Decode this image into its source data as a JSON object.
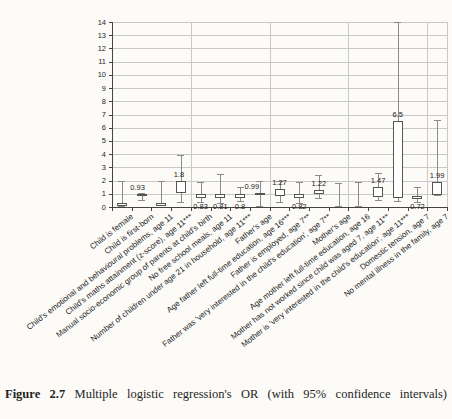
{
  "figure": {
    "label": "Figure 2.7",
    "caption": "Multiple logistic regression's OR (with 95% confidence intervals)"
  },
  "chart_data": {
    "type": "bar",
    "subtype": "odds-ratio-boxes-with-ci-whiskers",
    "title": "",
    "xlabel": "",
    "ylabel": "",
    "ylim": [
      0,
      14
    ],
    "ytick_labels": [
      "0",
      "1",
      "2",
      "3",
      "4",
      "5",
      "6",
      "7",
      "8",
      "9",
      "10",
      "11",
      "12",
      "13",
      "14"
    ],
    "grid": true,
    "legend": "none",
    "categories": [
      {
        "label": "Child is female",
        "or": null,
        "box": [
          0.05,
          0.3
        ],
        "whisker": [
          0.1,
          2.0
        ],
        "label_pos": null
      },
      {
        "label": "Child is first-born",
        "or": "0.93",
        "box": [
          0.8,
          1.0
        ],
        "whisker": [
          0.55,
          1.05
        ],
        "label_pos": "above",
        "solid": true,
        "dx": -4
      },
      {
        "label": "Child's emotional and behavioural problems, age 11",
        "or": null,
        "box": [
          0.1,
          0.32
        ],
        "whisker": [
          0.15,
          2.0
        ],
        "label_pos": null
      },
      {
        "label": "Child's maths attainment (z-score), age 11***",
        "or": "1.8",
        "box": [
          1.05,
          2.0
        ],
        "whisker": [
          0.35,
          3.9
        ],
        "label_pos": "above",
        "dx": -2
      },
      {
        "label": "Manual socio-economic group of parents at child's birth",
        "or": "0.83",
        "box": [
          0.7,
          1.02
        ],
        "whisker": [
          0.35,
          1.9
        ],
        "label_pos": "below"
      },
      {
        "label": "No free school meals, age 11",
        "or": "0.81",
        "box": [
          0.7,
          1.0
        ],
        "whisker": [
          0.3,
          2.5
        ],
        "label_pos": "below"
      },
      {
        "label": "Number of children under age 21 in household, age 11***",
        "or": "0.8",
        "box": [
          0.68,
          1.0
        ],
        "whisker": [
          0.45,
          1.5
        ],
        "label_pos": "below"
      },
      {
        "label": "Father's age",
        "or": "0.99",
        "box": [
          0.92,
          1.06
        ],
        "whisker": [
          0.1,
          2.0
        ],
        "label_pos": "above",
        "dx": -8
      },
      {
        "label": "Age father left full-time education, age 16***",
        "or": "1.27",
        "box": [
          0.85,
          1.35
        ],
        "whisker": [
          0.4,
          2.0
        ],
        "label_pos": "above"
      },
      {
        "label": "Father is employed, age 7**",
        "or": "0.82",
        "box": [
          0.65,
          0.95
        ],
        "whisker": [
          0.3,
          1.9
        ],
        "label_pos": "below"
      },
      {
        "label": "Father was 'very interested in the child's education', age 7**",
        "or": "1.22",
        "box": [
          0.95,
          1.3
        ],
        "whisker": [
          0.65,
          2.4
        ],
        "label_pos": "above"
      },
      {
        "label": "Mother's age",
        "or": null,
        "box": null,
        "whisker": [
          0.05,
          1.8
        ],
        "label_pos": null
      },
      {
        "label": "Age mother left full-time education, age 16",
        "or": null,
        "box": null,
        "whisker": [
          0.05,
          1.9
        ],
        "label_pos": null
      },
      {
        "label": "Mother has not worked since child was aged 7, age 11**",
        "or": "1.47",
        "box": [
          0.75,
          1.5
        ],
        "whisker": [
          0.5,
          2.6
        ],
        "label_pos": "above"
      },
      {
        "label": "Mother is 'very interested in the child's education', age 11***",
        "or": "6.5",
        "box": [
          0.7,
          6.5
        ],
        "whisker": [
          0.45,
          14.0
        ],
        "label_pos": "above"
      },
      {
        "label": "Domestic tension, age 7",
        "or": "0.72",
        "box": [
          0.58,
          0.85
        ],
        "whisker": [
          0.35,
          1.55
        ],
        "label_pos": "below"
      },
      {
        "label": "No mental illness in the family, age 7",
        "or": "1.99",
        "box": [
          0.9,
          1.9
        ],
        "whisker": [
          0.9,
          6.6
        ],
        "label_pos": "above"
      }
    ],
    "colors": {
      "grid": "#c9c9c9",
      "axis": "#444444",
      "whisker": "#8a8a8a",
      "box_border": "#555555",
      "box_fill": "#ffffff",
      "text": "#1f1f1f",
      "background": "#fcfbf8"
    }
  }
}
